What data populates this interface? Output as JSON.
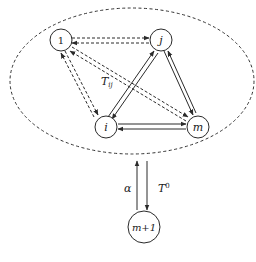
{
  "diagram": {
    "nodes": {
      "n1": {
        "label": "1"
      },
      "nj": {
        "label": "j"
      },
      "ni": {
        "label": "i"
      },
      "nm": {
        "label": "m"
      },
      "nm1": {
        "label": "m+1"
      }
    },
    "edge_labels": {
      "tij_main": "T",
      "tij_sub": "ij",
      "alpha": "α",
      "t0_main": "T",
      "t0_sup": "0"
    },
    "edges": [
      {
        "from": "1",
        "to": "j",
        "style": "dashed",
        "bidirectional": true
      },
      {
        "from": "1",
        "to": "i",
        "style": "dashed",
        "bidirectional": true
      },
      {
        "from": "1",
        "to": "m",
        "style": "dashed",
        "bidirectional": true
      },
      {
        "from": "i",
        "to": "j",
        "style": "solid",
        "bidirectional": true
      },
      {
        "from": "j",
        "to": "m",
        "style": "solid",
        "bidirectional": true
      },
      {
        "from": "i",
        "to": "m",
        "style": "solid",
        "bidirectional": true
      },
      {
        "from": "m+1",
        "to": "system",
        "style": "solid",
        "label": "α"
      },
      {
        "from": "system",
        "to": "m+1",
        "style": "solid",
        "label": "T0"
      }
    ],
    "boundary": {
      "style": "dashed-ellipse"
    }
  }
}
